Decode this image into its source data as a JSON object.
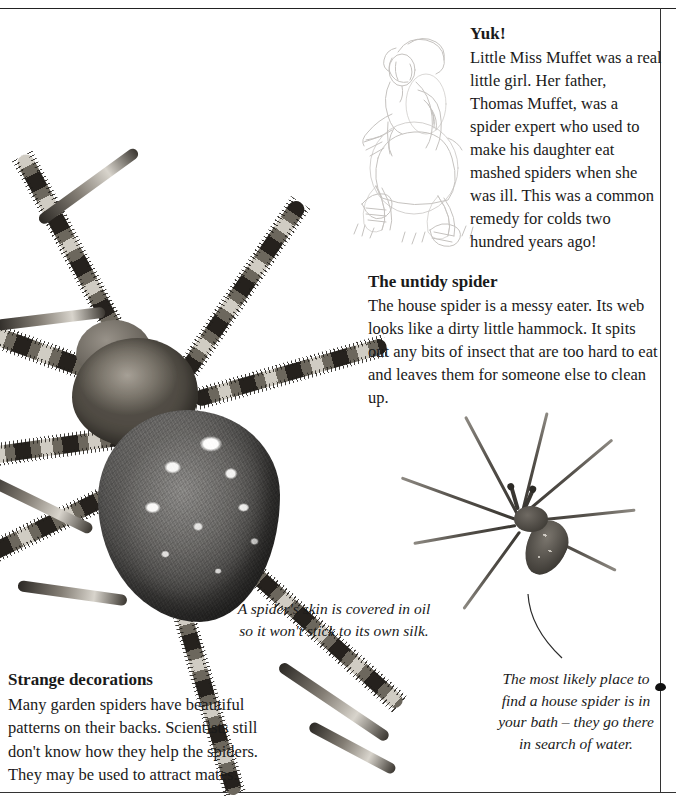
{
  "page": {
    "background_color": "#ffffff",
    "text_color": "#1a1a1a",
    "rule_color": "#333333"
  },
  "articles": {
    "yuk": {
      "heading": "Yuk!",
      "body": "Little Miss Muffet was a real little girl. Her father, Thomas Muffet, was a spider expert who used to make his daughter eat mashed spiders when she was ill. This was a common remedy for colds two hundred years ago!"
    },
    "untidy": {
      "heading": "The untidy spider",
      "body": "The house spider is a messy eater. Its web looks like a dirty little hammock. It spits out any bits of insect that are too hard to eat and leaves them for someone else to clean up."
    },
    "strange": {
      "heading": "Strange decorations",
      "body": "Many garden spiders have beautiful patterns on their backs. Scientists still don't know how they help the spiders. They may be used to attract mates."
    }
  },
  "captions": {
    "skin": "A spider's skin is covered in oil so it won't stick to its own silk.",
    "bath": "The most likely place to find a house spider is in your bath – they go there in search of water."
  },
  "figures": {
    "garden_spider": "garden-spider-photograph",
    "house_spider": "house-spider-photograph",
    "muffet_sketch": "little-miss-muffet-illustration",
    "leader_line": "caption-leader-line",
    "edge_marker": "page-edge-marker"
  }
}
